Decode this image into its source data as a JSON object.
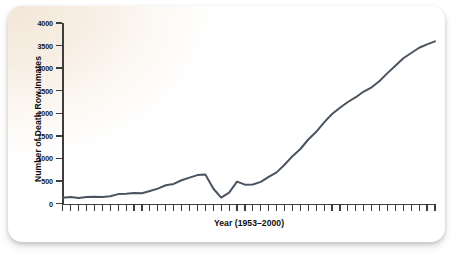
{
  "chart_data": {
    "type": "line",
    "title": "",
    "xlabel": "Year (1953–2000)",
    "ylabel": "Number of Death Row Inmates",
    "x": [
      1953,
      1954,
      1955,
      1956,
      1957,
      1958,
      1959,
      1960,
      1961,
      1962,
      1963,
      1964,
      1965,
      1966,
      1967,
      1968,
      1969,
      1970,
      1971,
      1972,
      1973,
      1974,
      1975,
      1976,
      1977,
      1978,
      1979,
      1980,
      1981,
      1982,
      1983,
      1984,
      1985,
      1986,
      1987,
      1988,
      1989,
      1990,
      1991,
      1992,
      1993,
      1994,
      1995,
      1996,
      1997,
      1998,
      1999,
      2000
    ],
    "values": [
      131,
      147,
      125,
      146,
      151,
      147,
      164,
      210,
      219,
      235,
      230,
      279,
      331,
      406,
      435,
      517,
      575,
      631,
      642,
      334,
      134,
      244,
      488,
      420,
      423,
      482,
      593,
      691,
      860,
      1050,
      1209,
      1420,
      1591,
      1800,
      1984,
      2124,
      2250,
      2356,
      2482,
      2575,
      2716,
      2890,
      3054,
      3219,
      3335,
      3452,
      3527,
      3593
    ],
    "ylim": [
      0,
      4000
    ],
    "yticks": [
      0,
      500,
      1000,
      1500,
      2000,
      2500,
      3000,
      3500,
      4000
    ],
    "ytick_labels": [
      "0",
      "500",
      "1000",
      "1500",
      "2000",
      "2500",
      "3000",
      "3500",
      "4000"
    ],
    "xtick_count": 48,
    "xtick_labels": [],
    "grid": false,
    "legend": false,
    "series_color": "#4a5460",
    "line_width": 2.0,
    "background_tint": "#f2e6d8",
    "axis_color": "#3d3d3d"
  }
}
